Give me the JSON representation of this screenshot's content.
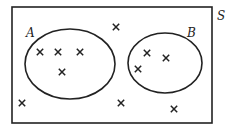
{
  "diagram": {
    "type": "venn",
    "universe_label": "S",
    "sets": [
      {
        "label": "A",
        "cx": 70,
        "cy": 64,
        "rx": 45,
        "ry": 35
      },
      {
        "label": "B",
        "cx": 165,
        "cy": 63,
        "rx": 37,
        "ry": 30
      }
    ],
    "elements": [
      {
        "region": "A",
        "x": 40,
        "y": 52
      },
      {
        "region": "A",
        "x": 58,
        "y": 52
      },
      {
        "region": "A",
        "x": 80,
        "y": 52
      },
      {
        "region": "A",
        "x": 62,
        "y": 72
      },
      {
        "region": "B",
        "x": 147,
        "y": 53
      },
      {
        "region": "B",
        "x": 166,
        "y": 58
      },
      {
        "region": "B",
        "x": 138,
        "y": 69
      },
      {
        "region": "outside",
        "x": 116,
        "y": 27
      },
      {
        "region": "outside",
        "x": 22,
        "y": 103
      },
      {
        "region": "outside",
        "x": 121,
        "y": 103
      },
      {
        "region": "outside",
        "x": 174,
        "y": 109
      }
    ]
  }
}
